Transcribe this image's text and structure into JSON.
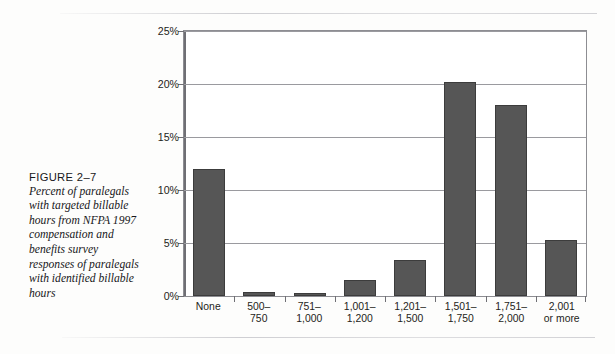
{
  "caption": {
    "figure_label": "FIGURE 2–7",
    "text": "Percent of paralegals with targeted billable hours from NFPA 1997 compensation and benefits survey responses of paralegals with identified billable hours"
  },
  "colors": {
    "bar_fill": "#565656",
    "bar_edge": "#3c3c3c",
    "gridline": "#9a9a9f",
    "axis": "#6f6f74",
    "page_background": "#fdfdfc"
  },
  "chart_data": {
    "type": "bar",
    "title": "",
    "xlabel": "",
    "ylabel": "",
    "ylim": [
      0,
      25
    ],
    "yticks": [
      0,
      5,
      10,
      15,
      20,
      25
    ],
    "ytick_labels": [
      "0%",
      "5%",
      "10%",
      "15%",
      "20%",
      "25%"
    ],
    "grid": true,
    "legend": "none",
    "categories": [
      "None",
      "500–\n750",
      "751–\n1,000",
      "1,001–\n1,200",
      "1,201–\n1,500",
      "1,501–\n1,750",
      "1,751–\n2,000",
      "2,001\nor more"
    ],
    "category_lines": [
      [
        "None",
        ""
      ],
      [
        "500–",
        "750"
      ],
      [
        "751–",
        "1,000"
      ],
      [
        "1,001–",
        "1,200"
      ],
      [
        "1,201–",
        "1,500"
      ],
      [
        "1,501–",
        "1,750"
      ],
      [
        "1,751–",
        "2,000"
      ],
      [
        "2,001",
        "or more"
      ]
    ],
    "values": [
      12.0,
      0.4,
      0.3,
      1.5,
      3.4,
      20.2,
      18.0,
      5.3
    ],
    "value_unit": "%"
  }
}
